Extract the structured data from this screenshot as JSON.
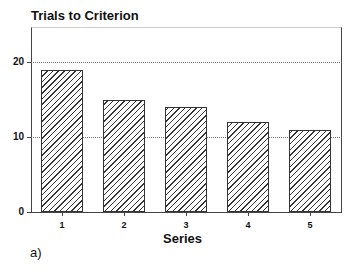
{
  "chart_data": {
    "type": "bar",
    "title": "Trials to Criterion",
    "xlabel": "Series",
    "ylabel": "",
    "categories": [
      "1",
      "2",
      "3",
      "4",
      "5"
    ],
    "values": [
      19,
      15,
      14,
      12,
      11
    ],
    "ylim": [
      0,
      25
    ],
    "yticks": [
      "0",
      "10",
      "20"
    ],
    "grid": "horizontal dotted at 10 and 20",
    "bar_style": "diagonal hatch",
    "panel_label": "a)"
  }
}
